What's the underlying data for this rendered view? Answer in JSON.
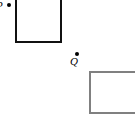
{
  "figure": {
    "kind": "geometry-diagram-fragment",
    "width": 135,
    "height": 125,
    "background_color": "#ffffff"
  },
  "points": [
    {
      "id": "p",
      "label": "P",
      "marker": "filled-dot",
      "marker_color": "#000000",
      "x": 9,
      "y": 5,
      "label_clipped_by_left_edge": true
    },
    {
      "id": "q",
      "label": "Q",
      "marker": "filled-dot",
      "marker_color": "#000000",
      "x": 77,
      "y": 54,
      "label_clipped_by_left_edge": false
    }
  ],
  "rectangles": [
    {
      "id": "upper-left",
      "stroke_color": "#111111",
      "fill_color": "#ffffff",
      "stroke_width": 2,
      "x": 15,
      "y": -5,
      "width": 47,
      "height": 48,
      "clipped_by_top_edge": true
    },
    {
      "id": "lower-right",
      "stroke_color": "#808080",
      "fill_color": "#ffffff",
      "stroke_width": 2,
      "x": 89,
      "y": 71,
      "width": 52,
      "height": 43,
      "clipped_by_right_edge": true
    }
  ]
}
